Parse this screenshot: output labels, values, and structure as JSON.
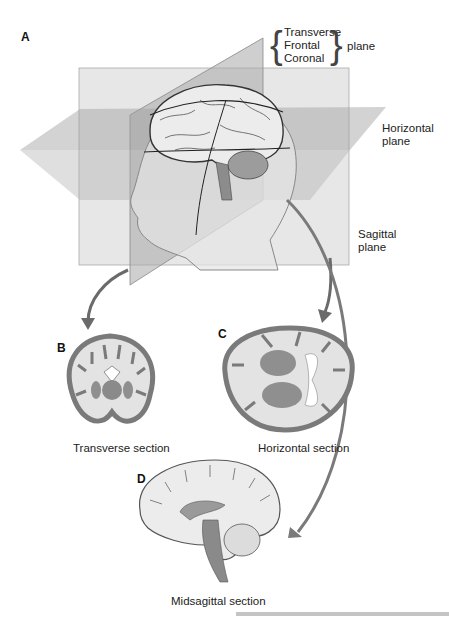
{
  "figure": {
    "panels": {
      "A": {
        "label": "A"
      },
      "B": {
        "label": "B",
        "caption": "Transverse section"
      },
      "C": {
        "label": "C",
        "caption": "Horizontal section"
      },
      "D": {
        "label": "D",
        "caption": "Midsagittal section"
      }
    },
    "plane_labels": {
      "bracket_terms": [
        "Transverse",
        "Frontal",
        "Coronal"
      ],
      "bracket_suffix": "plane",
      "horizontal": [
        "Horizontal",
        "plane"
      ],
      "sagittal": [
        "Sagittal",
        "plane"
      ]
    },
    "colors": {
      "plane_fill": "#c8c8c8",
      "plane_dark": "#9a9a9a",
      "tissue_gray": "#8a8a8a",
      "white_matter": "#e6e6e6",
      "arrow": "#666666"
    }
  }
}
